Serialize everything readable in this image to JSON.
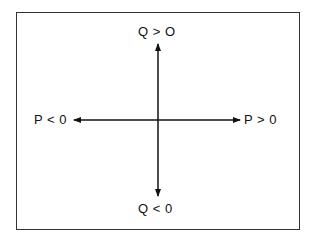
{
  "diagram": {
    "labels": {
      "top": "Q > O",
      "bottom": "Q < 0",
      "left": "P < 0",
      "right": "P > 0"
    },
    "axes": {
      "vertical": "Q",
      "horizontal": "P"
    },
    "colors": {
      "line": "#111111",
      "frame": "#333333",
      "background": "#ffffff"
    }
  }
}
